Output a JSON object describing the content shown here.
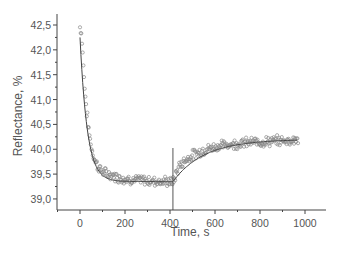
{
  "chart_data": {
    "type": "scatter",
    "title": "",
    "xlabel": "Time, s",
    "ylabel": "Reflectance, %",
    "xlim": [
      -100,
      1090
    ],
    "ylim": [
      38.78,
      42.78
    ],
    "xticks": [
      0,
      200,
      400,
      600,
      800,
      1000
    ],
    "xtick_labels": [
      "0",
      "200",
      "400",
      "600",
      "800",
      "1000"
    ],
    "yticks": [
      39.0,
      39.5,
      40.0,
      40.5,
      41.0,
      41.5,
      42.0,
      42.5
    ],
    "ytick_labels": [
      "39,0",
      "39,5",
      "40,0",
      "40,5",
      "41,0",
      "41,5",
      "42,0",
      "42,5"
    ],
    "grid": false,
    "legend": null,
    "marker": "open-circle",
    "colors": {
      "points": "#888888",
      "fit": "#444444",
      "axis": "#444444",
      "marker_line": "#555555"
    },
    "vertical_marker": {
      "x": 413,
      "y_top": 40.25
    },
    "series": [
      {
        "name": "measured",
        "style": "open circles",
        "x": [
          0,
          5,
          10,
          15,
          20,
          25,
          30,
          35,
          40,
          45,
          50,
          55,
          60,
          70,
          80,
          90,
          100,
          120,
          140,
          160,
          180,
          200,
          220,
          240,
          260,
          280,
          300,
          320,
          340,
          360,
          380,
          400,
          410,
          420,
          430,
          440,
          460,
          480,
          500,
          520,
          540,
          560,
          580,
          600,
          620,
          640,
          660,
          680,
          700,
          720,
          740,
          760,
          780,
          800,
          820,
          840,
          860,
          880,
          900,
          920,
          940,
          960,
          970
        ],
        "y": [
          42.45,
          42.4,
          42.1,
          41.7,
          41.3,
          41.0,
          40.75,
          40.55,
          40.35,
          40.2,
          40.05,
          39.95,
          39.85,
          39.75,
          39.65,
          39.6,
          39.55,
          39.5,
          39.48,
          39.45,
          39.42,
          39.4,
          39.4,
          39.38,
          39.38,
          39.37,
          39.37,
          39.36,
          39.36,
          39.35,
          39.35,
          39.35,
          39.33,
          39.4,
          39.55,
          39.65,
          39.75,
          39.82,
          39.88,
          39.92,
          39.96,
          40.0,
          40.02,
          40.05,
          40.07,
          40.08,
          40.1,
          40.1,
          40.12,
          40.12,
          40.13,
          40.14,
          40.14,
          40.15,
          40.15,
          40.16,
          40.16,
          40.17,
          40.17,
          40.18,
          40.18,
          40.19,
          40.2
        ]
      },
      {
        "name": "fit",
        "style": "solid line",
        "segments": [
          {
            "x_range": [
              0,
              413
            ],
            "form": "exponential decay",
            "y_start": 42.25,
            "y_end": 39.35
          },
          {
            "x_range": [
              413,
              970
            ],
            "form": "exponential rise",
            "y_start": 39.35,
            "y_end": 40.2
          }
        ]
      }
    ]
  }
}
